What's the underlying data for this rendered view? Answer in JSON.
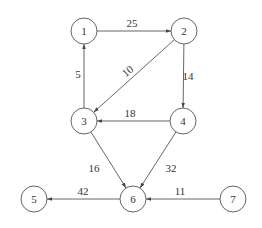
{
  "diagram": {
    "type": "directed-weighted-graph",
    "colors": {
      "stroke": "#555555",
      "text": "#333333",
      "background": "#ffffff"
    },
    "node_radius": 13,
    "nodes": [
      {
        "id": "1",
        "label": "1",
        "x": 84,
        "y": 31
      },
      {
        "id": "2",
        "label": "2",
        "x": 184,
        "y": 31
      },
      {
        "id": "3",
        "label": "3",
        "x": 84,
        "y": 121
      },
      {
        "id": "4",
        "label": "4",
        "x": 183,
        "y": 121
      },
      {
        "id": "5",
        "label": "5",
        "x": 34,
        "y": 199
      },
      {
        "id": "6",
        "label": "6",
        "x": 133,
        "y": 199
      },
      {
        "id": "7",
        "label": "7",
        "x": 233,
        "y": 199
      }
    ],
    "edges": [
      {
        "from": "1",
        "to": "2",
        "weight": "25",
        "label_x": 132,
        "label_y": 27
      },
      {
        "from": "3",
        "to": "1",
        "weight": "5",
        "label_x": 78,
        "label_y": 78
      },
      {
        "from": "2",
        "to": "3",
        "weight": "10",
        "label_x": 130,
        "label_y": 74,
        "label_rotate": -40
      },
      {
        "from": "2",
        "to": "4",
        "weight": "14",
        "label_x": 188,
        "label_y": 80
      },
      {
        "from": "4",
        "to": "3",
        "weight": "18",
        "label_x": 130,
        "label_y": 117
      },
      {
        "from": "3",
        "to": "6",
        "weight": "16",
        "label_x": 94,
        "label_y": 172
      },
      {
        "from": "4",
        "to": "6",
        "weight": "32",
        "label_x": 171,
        "label_y": 172
      },
      {
        "from": "6",
        "to": "5",
        "weight": "42",
        "label_x": 83,
        "label_y": 195
      },
      {
        "from": "7",
        "to": "6",
        "weight": "11",
        "label_x": 180,
        "label_y": 195
      }
    ]
  }
}
